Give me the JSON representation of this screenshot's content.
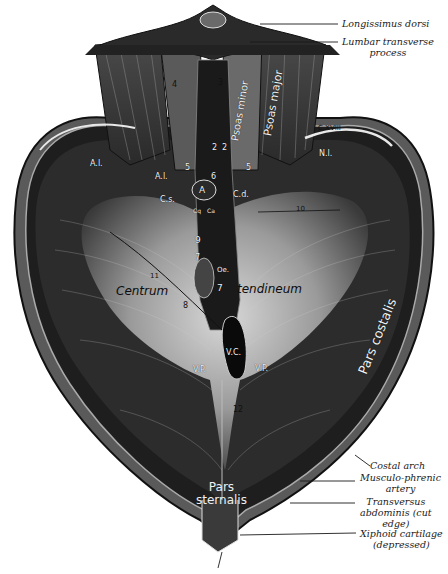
{
  "figure": {
    "colors": {
      "background": "#ffffff",
      "muscle_dark": "#1c1c1c",
      "tendon_light": "#bdbdbd",
      "line": "#1a1a1a"
    }
  },
  "external_labels": [
    {
      "id": "longissimus-dorsi",
      "text": "Longissimus dorsi"
    },
    {
      "id": "lumbar-transverse-process",
      "text": "Lumbar transverse",
      "text2": "process"
    },
    {
      "id": "costal-arch",
      "text": "Costal arch"
    },
    {
      "id": "musculo-phrenic-artery",
      "text": "Musculo-phrenic",
      "text2": "artery"
    },
    {
      "id": "transversus-abdominis",
      "text": "Transversus",
      "text2": "abdominis (cut",
      "text3": "edge)"
    },
    {
      "id": "xiphoid-cartilage",
      "text": "Xiphoid cartilage",
      "text2": "(depressed)"
    }
  ],
  "internal_labels": {
    "psoas_minor": "Psoas minor",
    "psoas_major": "Psoas major",
    "pars_costalis": "Pars costalis",
    "pars_sternalis_1": "Pars",
    "pars_sternalis_2": "sternalis",
    "centrum": "Centrum",
    "tendineum": "tendineum",
    "cxviii": "C.XVIII",
    "nl": "N.l.",
    "al_left": "A.l.",
    "al_inner": "A.l.",
    "cs": "C.s.",
    "cd": "C.d.",
    "a": "A",
    "cq": "Cq",
    "ca": "Ca",
    "oe": "Oe.",
    "vc": "V.C.",
    "vp_left": "V.P.",
    "vp_right": "V.P.",
    "n3": "3",
    "n4": "4",
    "n2a": "2",
    "n2b": "2",
    "n5a": "5",
    "n5b": "5",
    "n6": "6",
    "n7a": "7",
    "n7b": "7",
    "n8": "8",
    "n9": "9",
    "n10": "10",
    "n11": "11",
    "n12": "12"
  }
}
